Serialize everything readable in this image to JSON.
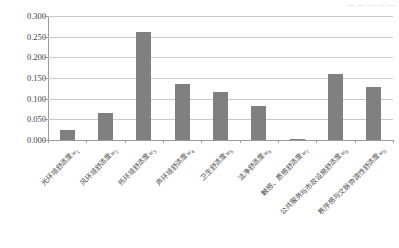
{
  "header": {
    "cropped_text": "— — — — —"
  },
  "chart_data": {
    "type": "bar",
    "title": "",
    "xlabel": "",
    "ylabel": "",
    "ylim": [
      0,
      0.3
    ],
    "grid": true,
    "legend": "none",
    "ytick_labels": [
      "0.000",
      "0.050",
      "0.100",
      "0.150",
      "0.200",
      "0.250",
      "0.300"
    ],
    "ytick_values": [
      0.0,
      0.05,
      0.1,
      0.15,
      0.2,
      0.25,
      0.3
    ],
    "categories": [
      "光环境舒适度",
      "风环境舒适度",
      "热环境舒适度",
      "声环境舒适度",
      "卫生舒适度",
      "洁净舒适度",
      "触感、质感舒适度",
      "公共服务与市政设施舒适度",
      "秩序感与文脉协调性舒适度"
    ],
    "category_symbols": [
      "w1",
      "w2",
      "w3",
      "w4",
      "w5",
      "w6",
      "w7",
      "w8",
      "w9"
    ],
    "category_subscripts": [
      "1",
      "2",
      "3",
      "4",
      "5",
      "6",
      "7",
      "8",
      "9"
    ],
    "category_symbol_letter": "w",
    "values": [
      0.025,
      0.065,
      0.262,
      0.136,
      0.115,
      0.082,
      0.003,
      0.16,
      0.129
    ],
    "bar_color": "#808080",
    "gridline_color": "#c9c9c9",
    "axis_color": "#9a9a9a",
    "background_color": "#ffffff"
  }
}
